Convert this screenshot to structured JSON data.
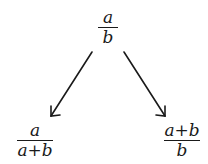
{
  "diagram": {
    "top": {
      "numerator": "a",
      "denominator": "b"
    },
    "left": {
      "numerator": "a",
      "denominator": "a+b"
    },
    "right": {
      "numerator": "a+b",
      "denominator": "b"
    },
    "arrows": [
      {
        "from": "top",
        "to": "left"
      },
      {
        "from": "top",
        "to": "right"
      }
    ],
    "colors": {
      "ink": "#1a1a1a",
      "background": "#ffffff"
    }
  }
}
